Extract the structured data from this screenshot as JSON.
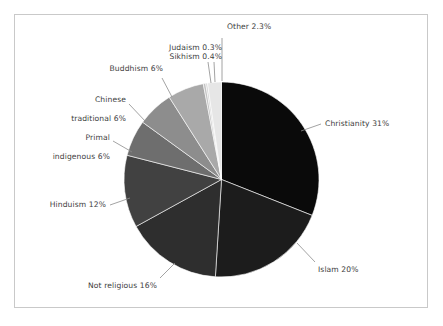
{
  "figure": {
    "frame_color": "#c9c9c9",
    "background": "#ffffff",
    "label_color": "#3d3d3d",
    "leader_color": "#8c8c8c"
  },
  "chart_data": {
    "type": "pie",
    "title": "",
    "subtitle": "",
    "xlabel": "",
    "ylabel": "",
    "legend_position": "none",
    "grid": false,
    "start_angle_deg": 0,
    "direction": "clockwise",
    "units": "percent",
    "categories": [
      "Christianity",
      "Islam",
      "Not religious",
      "Hinduism",
      "Primal indigenous",
      "Chinese traditional",
      "Buddhism",
      "Sikhism",
      "Judaism",
      "Other"
    ],
    "values": [
      31,
      20,
      16,
      12,
      6,
      6,
      6,
      0.4,
      0.3,
      2.3
    ],
    "colors": [
      "#0a0a0a",
      "#1c1c1c",
      "#2e2e2e",
      "#414141",
      "#6e6e6e",
      "#8d8d8d",
      "#a9a9a9",
      "#c2c2c2",
      "#d4d4d4",
      "#e6e6e6"
    ],
    "labels": [
      {
        "name": "Christianity",
        "text": "Christianity 31%",
        "value": 31
      },
      {
        "name": "Islam",
        "text": "Islam 20%",
        "value": 20
      },
      {
        "name": "Not religious",
        "text": "Not religious 16%",
        "value": 16
      },
      {
        "name": "Hinduism",
        "text": "Hinduism 12%",
        "value": 12
      },
      {
        "name": "Primal indigenous",
        "text_line1": "Primal",
        "text_line2": "indigenous 6%",
        "value": 6
      },
      {
        "name": "Chinese traditional",
        "text_line1": "Chinese",
        "text_line2": "traditional 6%",
        "value": 6
      },
      {
        "name": "Buddhism",
        "text": "Buddhism 6%",
        "value": 6
      },
      {
        "name": "Sikhism",
        "text": "Sikhism 0.4%",
        "value": 0.4
      },
      {
        "name": "Judaism",
        "text": "Judaism 0.3%",
        "value": 0.3
      },
      {
        "name": "Other",
        "text": "Other 2.3%",
        "value": 2.3
      }
    ]
  },
  "labels_text": {
    "christianity": "Christianity 31%",
    "islam": "Islam 20%",
    "not_religious": "Not religious 16%",
    "hinduism": "Hinduism 12%",
    "primal_l1": "Primal",
    "primal_l2": "indigenous 6%",
    "chinese_l1": "Chinese",
    "chinese_l2": "traditional 6%",
    "buddhism": "Buddhism 6%",
    "judaism": "Judaism 0.3%",
    "sikhism": "Sikhism 0.4%",
    "other": "Other 2.3%"
  }
}
